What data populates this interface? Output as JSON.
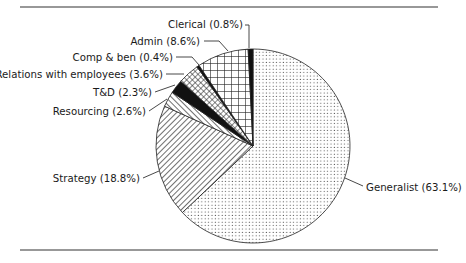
{
  "chart_data": {
    "type": "pie",
    "title": "",
    "start_angle_deg": 0,
    "direction": "clockwise",
    "center": [
      253,
      146
    ],
    "radius": 97,
    "slices": [
      {
        "label": "Generalist",
        "value": 63.1,
        "display": "Generalist (63.1%)",
        "pattern": "dots"
      },
      {
        "label": "Strategy",
        "value": 18.8,
        "display": "Strategy (18.8%)",
        "pattern": "diag-back"
      },
      {
        "label": "Resourcing",
        "value": 2.6,
        "display": "Resourcing (2.6%)",
        "pattern": "diag-fwd"
      },
      {
        "label": "T&D",
        "value": 2.3,
        "display": "T&D (2.3%)",
        "pattern": "solid"
      },
      {
        "label": "Relations with employees",
        "value": 3.6,
        "display": "Relations with employees (3.6%)",
        "pattern": "crosshatch"
      },
      {
        "label": "Comp & ben",
        "value": 0.4,
        "display": "Comp & ben (0.4%)",
        "pattern": "solid"
      },
      {
        "label": "Admin",
        "value": 8.6,
        "display": "Admin (8.6%)",
        "pattern": "grid"
      },
      {
        "label": "Clerical",
        "value": 0.8,
        "display": "Clerical (0.8%)",
        "pattern": "solid"
      }
    ],
    "labels": [
      {
        "key": "Generalist",
        "text": "Generalist (63.1%)",
        "x": 366,
        "y": 191,
        "anchor": "start",
        "leader": [
          [
            345,
            178
          ],
          [
            363,
            186
          ]
        ]
      },
      {
        "key": "Strategy",
        "text": "Strategy (18.8%)",
        "x": 140,
        "y": 182,
        "anchor": "end",
        "leader": [
          [
            143,
            178
          ],
          [
            159,
            171
          ]
        ]
      },
      {
        "key": "Resourcing",
        "text": "Resourcing (2.6%)",
        "x": 146,
        "y": 115,
        "anchor": "end",
        "leader": [
          [
            149,
            111
          ],
          [
            167,
            99
          ]
        ]
      },
      {
        "key": "T&D",
        "text": "T&D (2.3%)",
        "x": 152,
        "y": 96,
        "anchor": "end",
        "leader": [
          [
            155,
            92
          ],
          [
            175,
            85
          ]
        ]
      },
      {
        "key": "Relations with employees",
        "text": "Relations with employees (3.6%)",
        "x": 163,
        "y": 78,
        "anchor": "end",
        "leader": [
          [
            166,
            74
          ],
          [
            184,
            74
          ]
        ]
      },
      {
        "key": "Comp & ben",
        "text": "Comp & ben (0.4%)",
        "x": 173,
        "y": 61,
        "anchor": "end",
        "leader": [
          [
            176,
            57
          ],
          [
            192,
            57
          ],
          [
            199,
            65
          ]
        ]
      },
      {
        "key": "Admin",
        "text": "Admin (8.6%)",
        "x": 200,
        "y": 45,
        "anchor": "end",
        "leader": [
          [
            204,
            41
          ],
          [
            219,
            41
          ],
          [
            228,
            51
          ]
        ]
      },
      {
        "key": "Clerical",
        "text": "Clerical (0.8%)",
        "x": 243,
        "y": 28,
        "anchor": "end",
        "leader": [
          [
            245,
            25
          ],
          [
            249,
            25
          ],
          [
            249,
            48
          ]
        ]
      }
    ],
    "legend": "none",
    "rules": {
      "top_y": 7,
      "bottom_y": 250,
      "x1": 20,
      "x2": 438
    }
  }
}
